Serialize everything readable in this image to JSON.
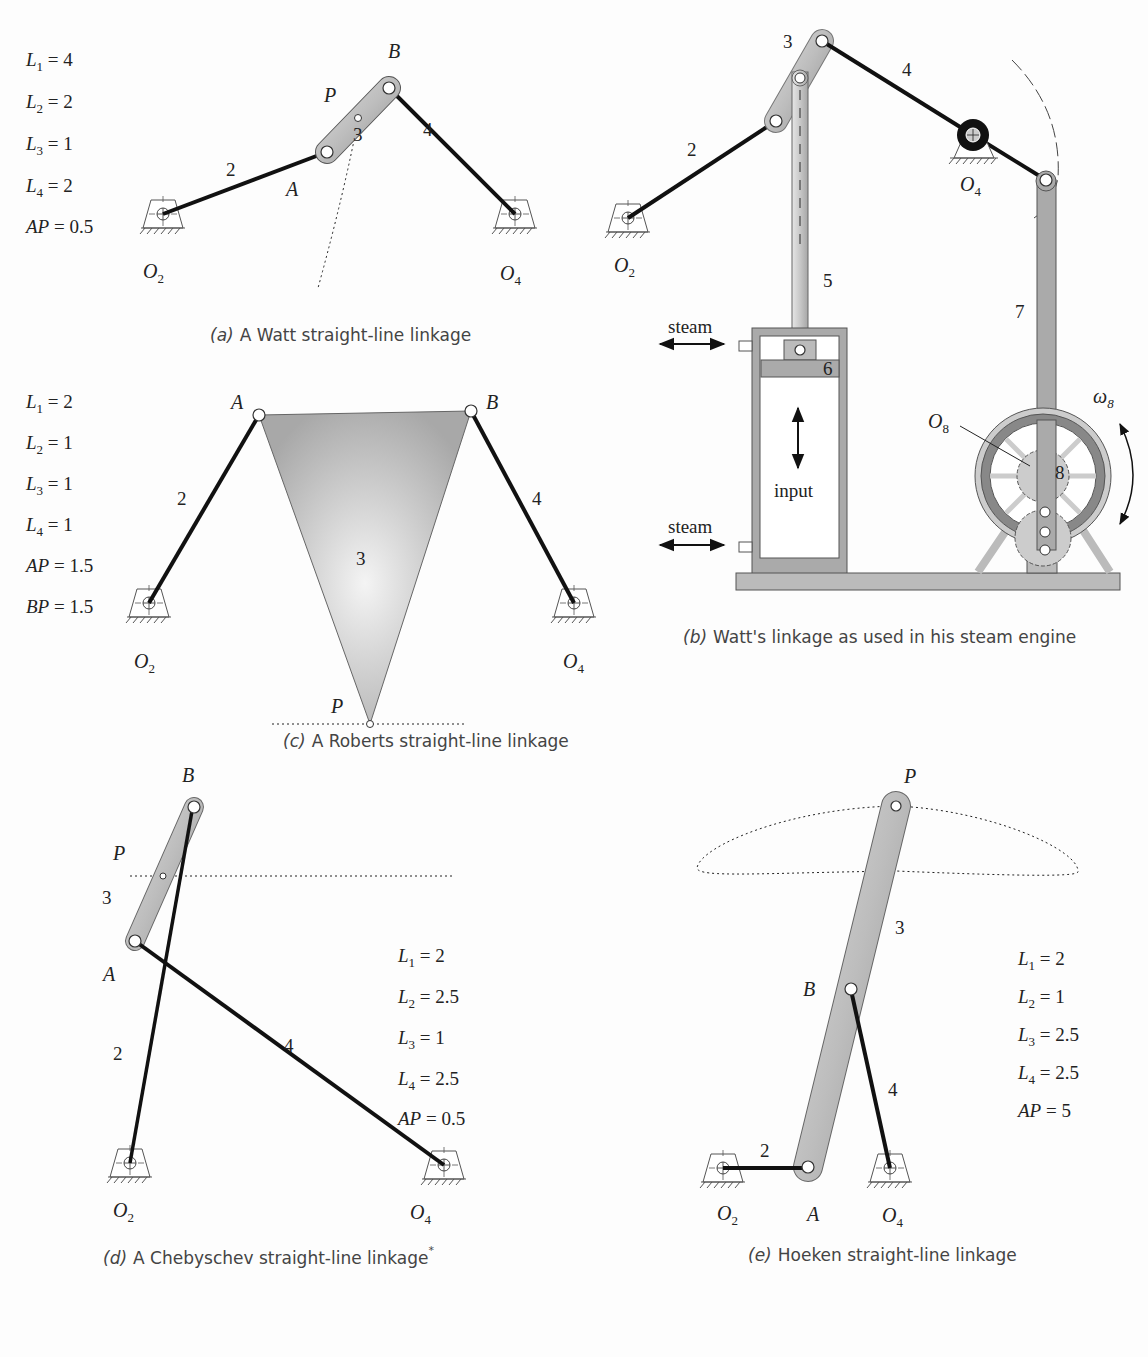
{
  "figure": {
    "panels": [
      {
        "id": "a",
        "caption_letter": "(a)",
        "caption": "A Watt straight-line linkage",
        "params": [
          "L1 = 4",
          "L2 = 2",
          "L3 = 1",
          "L4 = 2",
          "AP = 0.5"
        ],
        "labels": {
          "A": "A",
          "B": "B",
          "P": "P",
          "O2": "O",
          "O2sub": "2",
          "O4": "O",
          "O4sub": "4"
        },
        "links": [
          "2",
          "3",
          "4"
        ]
      },
      {
        "id": "b",
        "caption_letter": "(b)",
        "caption": "Watt's linkage as used in his steam engine",
        "labels": {
          "O2": "O",
          "O2sub": "2",
          "O4": "O",
          "O4sub": "4",
          "O8": "O",
          "O8sub": "8",
          "omega": "ω",
          "omegasub": "8"
        },
        "links": [
          "2",
          "3",
          "4",
          "5",
          "6",
          "7",
          "8"
        ],
        "text": {
          "steam_top": "steam",
          "steam_bottom": "steam",
          "input": "input"
        }
      },
      {
        "id": "c",
        "caption_letter": "(c)",
        "caption": "A Roberts straight-line linkage",
        "params": [
          "L1 = 2",
          "L2 = 1",
          "L3 = 1",
          "L4 = 1",
          "AP = 1.5",
          "BP = 1.5"
        ],
        "labels": {
          "A": "A",
          "B": "B",
          "P": "P",
          "O2": "O",
          "O2sub": "2",
          "O4": "O",
          "O4sub": "4"
        },
        "links": [
          "2",
          "3",
          "4"
        ]
      },
      {
        "id": "d",
        "caption_letter": "(d)",
        "caption": "A Chebyschev straight-line linkage",
        "caption_mark": "*",
        "params": [
          "L1 = 2",
          "L2 = 2.5",
          "L3 = 1",
          "L4 = 2.5",
          "AP = 0.5"
        ],
        "labels": {
          "A": "A",
          "B": "B",
          "P": "P",
          "O2": "O",
          "O2sub": "2",
          "O4": "O",
          "O4sub": "4"
        },
        "links": [
          "2",
          "3",
          "4"
        ]
      },
      {
        "id": "e",
        "caption_letter": "(e)",
        "caption": "Hoeken straight-line linkage",
        "params": [
          "L1 = 2",
          "L2 = 1",
          "L3 = 2.5",
          "L4 = 2.5",
          "AP = 5"
        ],
        "labels": {
          "A": "A",
          "B": "B",
          "P": "P",
          "O2": "O",
          "O2sub": "2",
          "O4": "O",
          "O4sub": "4"
        },
        "links": [
          "2",
          "3",
          "4"
        ]
      }
    ]
  }
}
